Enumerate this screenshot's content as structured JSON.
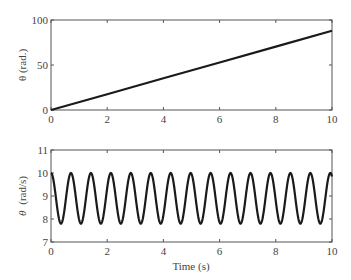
{
  "chart_data": [
    {
      "type": "line",
      "title": "",
      "xlabel": "",
      "ylabel": "θ (rad.)",
      "xlim": [
        0,
        10
      ],
      "ylim": [
        0,
        100
      ],
      "xticks": [
        "0",
        "2",
        "4",
        "6",
        "8",
        "10"
      ],
      "yticks": [
        "0",
        "50",
        "100"
      ],
      "grid": false,
      "series": [
        {
          "name": "theta",
          "x": [
            0,
            2,
            4,
            6,
            8,
            10
          ],
          "values": [
            0,
            17.6,
            35.2,
            52.8,
            70.4,
            88
          ]
        }
      ],
      "color": "#1a1a1a"
    },
    {
      "type": "line",
      "title": "",
      "xlabel": "Time (s)",
      "ylabel": "θ̇ (rad/s)",
      "xlim": [
        0,
        10
      ],
      "ylim": [
        7,
        11
      ],
      "xticks": [
        "0",
        "2",
        "4",
        "6",
        "8",
        "10"
      ],
      "yticks": [
        "7",
        "8",
        "9",
        "10",
        "11"
      ],
      "grid": false,
      "series": [
        {
          "name": "theta_dot",
          "description": "sinusoid oscillating between ~7.8 and ~10.0, period ~0.71 s, starting at peak",
          "mean": 8.9,
          "amplitude": 1.1,
          "period": 0.71,
          "phase_start": "peak"
        }
      ],
      "color": "#1a1a1a"
    }
  ],
  "labels": {
    "top_ylabel": "θ (rad.)",
    "bottom_ylabel_symbol": "θ",
    "bottom_ylabel_units": "(rad/s)",
    "xlabel": "Time (s)"
  }
}
